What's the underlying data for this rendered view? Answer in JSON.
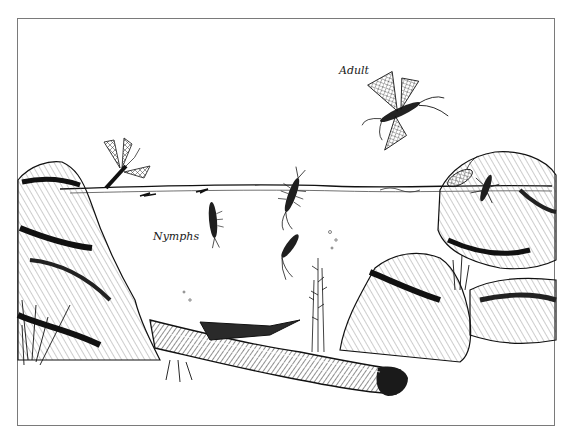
{
  "illustration": {
    "subject": "mayfly life cycle pen-and-ink drawing",
    "labels": {
      "adult": "Adult",
      "nymphs": "Nymphs"
    },
    "elements": [
      "adult-mayfly-flying",
      "subimago-emerging-at-surface-left",
      "nymph-at-surface-center",
      "swimming-nymphs",
      "adult-and-nymph-on-right-rock",
      "water-surface-line",
      "left-rock",
      "right-rocks",
      "submerged-log",
      "aquatic-plant",
      "grass-tufts"
    ],
    "colors": {
      "ink": "#111111",
      "paper": "#ffffff",
      "frame": "#7a7a7a"
    }
  }
}
